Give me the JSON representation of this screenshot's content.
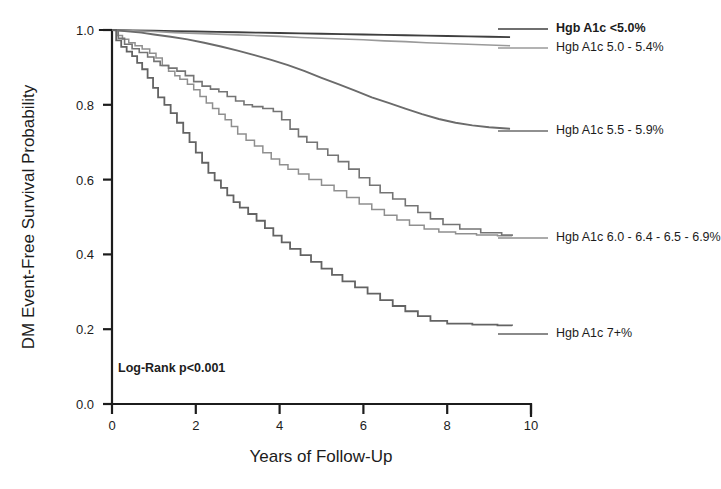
{
  "figure": {
    "background": "#ffffff",
    "annotation": "Log-Rank p<0.001"
  },
  "axes": {
    "y_title": "DM Event-Free Survival Probability",
    "x_title": "Years of Follow-Up",
    "y_ticks": [
      "0.0",
      "0.2",
      "0.4",
      "0.6",
      "0.8",
      "1.0"
    ],
    "x_ticks": [
      "0",
      "2",
      "4",
      "6",
      "8",
      "10"
    ]
  },
  "legend": [
    {
      "label": "Hgb A1c <5.0%",
      "color": "#3f3f3f",
      "bold": true
    },
    {
      "label": "Hgb A1c 5.0 - 5.4%",
      "color": "#9a9a9a",
      "bold": false
    },
    {
      "label": "Hgb A1c 5.5 - 5.9%",
      "color": "#6b6b6b",
      "bold": false
    },
    {
      "label": "Hgb A1c 6.0 - 6.4 - 6.5 - 6.9%",
      "color": "#8f8f8f",
      "bold": false
    },
    {
      "label": "Hgb A1c 7+%",
      "color": "#636363",
      "bold": false
    }
  ],
  "chart_data": {
    "type": "line",
    "title": "",
    "subtitle": "",
    "xlabel": "Years of Follow-Up",
    "ylabel": "DM Event-Free Survival Probability",
    "xlim": [
      0,
      10
    ],
    "ylim": [
      0.0,
      1.0
    ],
    "xticks": [
      0,
      2,
      4,
      6,
      8,
      10
    ],
    "yticks": [
      0.0,
      0.2,
      0.4,
      0.6,
      0.8,
      1.0
    ],
    "grid": false,
    "legend_position": "right-inline",
    "annotations": [
      {
        "text": "Log-Rank p<0.001",
        "x": 0.15,
        "y": 0.09
      }
    ],
    "series": [
      {
        "name": "Hgb A1c <5.0%",
        "color": "#3f3f3f",
        "width": 1.8,
        "points": [
          [
            0.0,
            1.0
          ],
          [
            0.5,
            0.999
          ],
          [
            1.0,
            0.998
          ],
          [
            1.5,
            0.997
          ],
          [
            2.0,
            0.996
          ],
          [
            2.5,
            0.995
          ],
          [
            3.0,
            0.994
          ],
          [
            3.5,
            0.993
          ],
          [
            4.0,
            0.992
          ],
          [
            4.5,
            0.991
          ],
          [
            5.0,
            0.99
          ],
          [
            5.5,
            0.989
          ],
          [
            6.0,
            0.988
          ],
          [
            6.5,
            0.987
          ],
          [
            7.0,
            0.986
          ],
          [
            7.5,
            0.985
          ],
          [
            8.0,
            0.984
          ],
          [
            8.5,
            0.983
          ],
          [
            9.0,
            0.982
          ],
          [
            9.5,
            0.981
          ]
        ]
      },
      {
        "name": "Hgb A1c 5.0 - 5.4%",
        "color": "#9a9a9a",
        "width": 1.6,
        "points": [
          [
            0.0,
            1.0
          ],
          [
            0.5,
            0.998
          ],
          [
            1.0,
            0.996
          ],
          [
            1.5,
            0.993
          ],
          [
            2.0,
            0.991
          ],
          [
            2.5,
            0.989
          ],
          [
            3.0,
            0.987
          ],
          [
            3.5,
            0.985
          ],
          [
            4.0,
            0.983
          ],
          [
            4.5,
            0.98
          ],
          [
            5.0,
            0.978
          ],
          [
            5.5,
            0.976
          ],
          [
            6.0,
            0.974
          ],
          [
            6.5,
            0.971
          ],
          [
            7.0,
            0.969
          ],
          [
            7.5,
            0.966
          ],
          [
            8.0,
            0.964
          ],
          [
            8.5,
            0.962
          ],
          [
            9.0,
            0.96
          ],
          [
            9.5,
            0.958
          ]
        ]
      },
      {
        "name": "Hgb A1c 5.5 - 5.9%",
        "color": "#6b6b6b",
        "width": 1.9,
        "points": [
          [
            0.0,
            1.0
          ],
          [
            0.3,
            0.997
          ],
          [
            0.7,
            0.993
          ],
          [
            1.0,
            0.988
          ],
          [
            1.4,
            0.982
          ],
          [
            1.8,
            0.975
          ],
          [
            2.2,
            0.966
          ],
          [
            2.6,
            0.956
          ],
          [
            3.0,
            0.945
          ],
          [
            3.4,
            0.933
          ],
          [
            3.8,
            0.92
          ],
          [
            4.2,
            0.906
          ],
          [
            4.6,
            0.89
          ],
          [
            5.0,
            0.872
          ],
          [
            5.4,
            0.855
          ],
          [
            5.8,
            0.838
          ],
          [
            6.2,
            0.82
          ],
          [
            6.6,
            0.805
          ],
          [
            7.0,
            0.79
          ],
          [
            7.4,
            0.775
          ],
          [
            7.8,
            0.762
          ],
          [
            8.2,
            0.752
          ],
          [
            8.6,
            0.745
          ],
          [
            9.0,
            0.74
          ],
          [
            9.5,
            0.736
          ]
        ]
      },
      {
        "name": "Hgb A1c 6.0 - 6.4%",
        "color": "#8f8f8f",
        "width": 1.5,
        "step": true,
        "points": [
          [
            0.0,
            1.0
          ],
          [
            0.12,
            0.985
          ],
          [
            0.25,
            0.975
          ],
          [
            0.4,
            0.966
          ],
          [
            0.55,
            0.958
          ],
          [
            0.72,
            0.949
          ],
          [
            0.9,
            0.938
          ],
          [
            1.05,
            0.925
          ],
          [
            1.2,
            0.905
          ],
          [
            1.35,
            0.89
          ],
          [
            1.5,
            0.878
          ],
          [
            1.62,
            0.868
          ],
          [
            1.8,
            0.855
          ],
          [
            1.95,
            0.84
          ],
          [
            2.1,
            0.822
          ],
          [
            2.25,
            0.805
          ],
          [
            2.4,
            0.79
          ],
          [
            2.55,
            0.775
          ],
          [
            2.7,
            0.76
          ],
          [
            2.85,
            0.742
          ],
          [
            3.0,
            0.722
          ],
          [
            3.2,
            0.705
          ],
          [
            3.4,
            0.69
          ],
          [
            3.6,
            0.672
          ],
          [
            3.8,
            0.655
          ],
          [
            4.0,
            0.64
          ],
          [
            4.2,
            0.628
          ],
          [
            4.45,
            0.615
          ],
          [
            4.7,
            0.6
          ],
          [
            5.0,
            0.585
          ],
          [
            5.3,
            0.57
          ],
          [
            5.6,
            0.552
          ],
          [
            5.9,
            0.535
          ],
          [
            6.2,
            0.52
          ],
          [
            6.5,
            0.505
          ],
          [
            6.8,
            0.492
          ],
          [
            7.1,
            0.478
          ],
          [
            7.45,
            0.468
          ],
          [
            7.8,
            0.46
          ],
          [
            8.2,
            0.455
          ],
          [
            8.7,
            0.452
          ],
          [
            9.2,
            0.45
          ],
          [
            9.55,
            0.449
          ]
        ]
      },
      {
        "name": "Hgb A1c 6.5 - 6.9%",
        "color": "#747474",
        "width": 1.6,
        "step": true,
        "points": [
          [
            0.0,
            1.0
          ],
          [
            0.15,
            0.978
          ],
          [
            0.3,
            0.962
          ],
          [
            0.48,
            0.95
          ],
          [
            0.65,
            0.94
          ],
          [
            0.85,
            0.928
          ],
          [
            1.0,
            0.916
          ],
          [
            1.15,
            0.905
          ],
          [
            1.35,
            0.898
          ],
          [
            1.55,
            0.89
          ],
          [
            1.75,
            0.878
          ],
          [
            1.95,
            0.862
          ],
          [
            2.15,
            0.85
          ],
          [
            2.35,
            0.842
          ],
          [
            2.55,
            0.835
          ],
          [
            2.75,
            0.822
          ],
          [
            2.95,
            0.81
          ],
          [
            3.15,
            0.8
          ],
          [
            3.35,
            0.795
          ],
          [
            3.6,
            0.79
          ],
          [
            3.85,
            0.782
          ],
          [
            4.05,
            0.76
          ],
          [
            4.25,
            0.735
          ],
          [
            4.45,
            0.715
          ],
          [
            4.65,
            0.7
          ],
          [
            4.9,
            0.682
          ],
          [
            5.15,
            0.665
          ],
          [
            5.4,
            0.648
          ],
          [
            5.65,
            0.628
          ],
          [
            5.9,
            0.605
          ],
          [
            6.15,
            0.585
          ],
          [
            6.4,
            0.565
          ],
          [
            6.7,
            0.548
          ],
          [
            7.0,
            0.53
          ],
          [
            7.3,
            0.512
          ],
          [
            7.6,
            0.495
          ],
          [
            7.9,
            0.48
          ],
          [
            8.3,
            0.468
          ],
          [
            8.8,
            0.458
          ],
          [
            9.3,
            0.452
          ],
          [
            9.55,
            0.45
          ]
        ]
      },
      {
        "name": "Hgb A1c 7+%",
        "color": "#636363",
        "width": 1.8,
        "step": true,
        "points": [
          [
            0.0,
            1.0
          ],
          [
            0.1,
            0.972
          ],
          [
            0.22,
            0.955
          ],
          [
            0.35,
            0.942
          ],
          [
            0.48,
            0.93
          ],
          [
            0.6,
            0.912
          ],
          [
            0.72,
            0.895
          ],
          [
            0.85,
            0.872
          ],
          [
            0.98,
            0.845
          ],
          [
            1.1,
            0.82
          ],
          [
            1.25,
            0.8
          ],
          [
            1.4,
            0.778
          ],
          [
            1.55,
            0.752
          ],
          [
            1.7,
            0.725
          ],
          [
            1.85,
            0.7
          ],
          [
            2.0,
            0.672
          ],
          [
            2.15,
            0.645
          ],
          [
            2.3,
            0.618
          ],
          [
            2.45,
            0.598
          ],
          [
            2.6,
            0.578
          ],
          [
            2.75,
            0.558
          ],
          [
            2.9,
            0.54
          ],
          [
            3.05,
            0.525
          ],
          [
            3.25,
            0.508
          ],
          [
            3.45,
            0.49
          ],
          [
            3.65,
            0.47
          ],
          [
            3.85,
            0.45
          ],
          [
            4.05,
            0.432
          ],
          [
            4.25,
            0.415
          ],
          [
            4.5,
            0.398
          ],
          [
            4.75,
            0.38
          ],
          [
            5.0,
            0.362
          ],
          [
            5.25,
            0.345
          ],
          [
            5.5,
            0.328
          ],
          [
            5.8,
            0.312
          ],
          [
            6.1,
            0.295
          ],
          [
            6.4,
            0.278
          ],
          [
            6.7,
            0.262
          ],
          [
            7.0,
            0.248
          ],
          [
            7.3,
            0.235
          ],
          [
            7.6,
            0.222
          ],
          [
            8.0,
            0.215
          ],
          [
            8.6,
            0.212
          ],
          [
            9.2,
            0.21
          ],
          [
            9.55,
            0.209
          ]
        ]
      }
    ]
  },
  "label_anchors": [
    {
      "series": "Hgb A1c <5.0%",
      "x": 556,
      "y": 29
    },
    {
      "series": "Hgb A1c 5.0 - 5.4%",
      "x": 556,
      "y": 48
    },
    {
      "series": "Hgb A1c 5.5 - 5.9%",
      "x": 556,
      "y": 131
    },
    {
      "series": "Hgb A1c 6.0 - 6.4 - 6.5 - 6.9%",
      "x": 556,
      "y": 238
    },
    {
      "series": "Hgb A1c 7+%",
      "x": 556,
      "y": 334
    }
  ]
}
